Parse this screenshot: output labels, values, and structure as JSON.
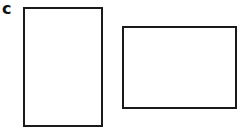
{
  "panel": {
    "label": "c",
    "shapes": [
      {
        "type": "rectangle",
        "orientation": "portrait"
      },
      {
        "type": "rectangle",
        "orientation": "landscape"
      }
    ]
  }
}
